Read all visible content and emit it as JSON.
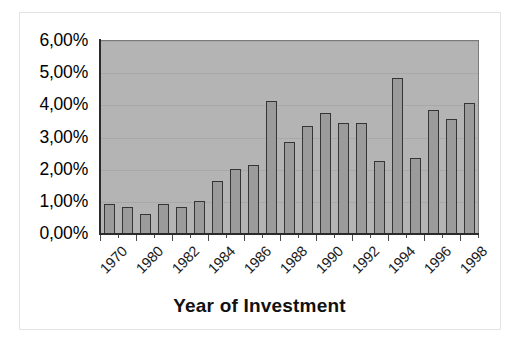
{
  "chart_data": {
    "type": "bar",
    "title": "",
    "xlabel": "Year of Investment",
    "ylabel": "",
    "grid": true,
    "legend": "none",
    "ylim": [
      0,
      6
    ],
    "y_ticks": [
      0,
      1,
      2,
      3,
      4,
      5,
      6
    ],
    "y_tick_labels": [
      "0,00%",
      "1,00%",
      "2,00%",
      "3,00%",
      "4,00%",
      "5,00%",
      "6,00%"
    ],
    "x_tick_labels": [
      "1970",
      "1980",
      "1982",
      "1984",
      "1986",
      "1988",
      "1990",
      "1992",
      "1994",
      "1996",
      "1998"
    ],
    "x_tick_bar_indices": [
      0,
      2,
      4,
      6,
      8,
      10,
      12,
      14,
      16,
      18,
      20
    ],
    "categories": [
      "1970",
      "1979",
      "1980",
      "1981",
      "1982",
      "1983",
      "1984",
      "1985",
      "1986",
      "1987",
      "1988",
      "1989",
      "1990",
      "1991",
      "1992",
      "1993",
      "1994",
      "1995",
      "1996",
      "1997",
      "1998"
    ],
    "values": [
      0.92,
      0.83,
      0.63,
      0.92,
      0.83,
      1.03,
      1.64,
      2.03,
      2.15,
      4.13,
      2.86,
      3.36,
      3.77,
      3.46,
      3.46,
      2.27,
      4.86,
      2.36,
      3.87,
      3.58,
      4.07
    ],
    "value_labels": [
      "0,92%",
      "0,83%",
      "0,63%",
      "0,92%",
      "0,83%",
      "1,03%",
      "1,64%",
      "2,03%",
      "2,15%",
      "4,13%",
      "2,86%",
      "3,36%",
      "3,77%",
      "3,46%",
      "3,46%",
      "2,27%",
      "4,86%",
      "2,36%",
      "3,87%",
      "3,58%",
      "4,07%"
    ]
  },
  "style": {
    "plot_background": "#b4b4b4",
    "bar_fill": "#9b9b9b",
    "bar_border": "#353535",
    "gridline_color": "#a8a8a8",
    "axis_color": "#2b2b2b",
    "text_color": "#000000",
    "page_background": "#ffffff"
  }
}
